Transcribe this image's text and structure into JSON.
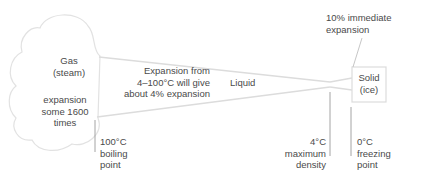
{
  "diagram": {
    "gas": {
      "title": "Gas",
      "subtitle": "(steam)",
      "note_lines": [
        "expansion",
        "some 1600",
        "times"
      ]
    },
    "liquid": {
      "label": "Liquid",
      "note_lines": [
        "Expansion from",
        "4–100°C will give",
        "about 4% expansion"
      ]
    },
    "solid": {
      "title": "Solid",
      "subtitle": "(ice)",
      "note_lines": [
        "10% immediate",
        "expansion"
      ]
    },
    "markers": [
      {
        "temp": "100°C",
        "lines": [
          "boiling",
          "point"
        ]
      },
      {
        "temp": "4°C",
        "lines": [
          "maximum",
          "density"
        ]
      },
      {
        "temp": "0°C",
        "lines": [
          "freezing",
          "point"
        ]
      }
    ],
    "colors": {
      "outline": "#d8d8d8",
      "marker_line": "#9a9a9a",
      "text": "#4a4a4a"
    }
  }
}
